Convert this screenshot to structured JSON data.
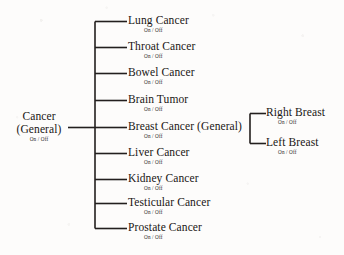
{
  "diagram": {
    "type": "tree",
    "state_label": "On / Off",
    "line_color": "#231f1e",
    "background_color": "#fdfcfb",
    "root": {
      "label_line1": "Cancer",
      "label_line2": "(General)",
      "state": "On / Off"
    },
    "branches": [
      {
        "label": "Lung Cancer",
        "state": "On / Off"
      },
      {
        "label": "Throat Cancer",
        "state": "On / Off"
      },
      {
        "label": "Bowel Cancer",
        "state": "On / Off"
      },
      {
        "label": "Brain Tumor",
        "state": "On / Off"
      },
      {
        "label": "Breast Cancer (General)",
        "state": "On / Off"
      },
      {
        "label": "Liver Cancer",
        "state": "On / Off"
      },
      {
        "label": "Kidney Cancer",
        "state": "On / Off"
      },
      {
        "label": "Testicular Cancer",
        "state": "On / Off"
      },
      {
        "label": "Prostate Cancer",
        "state": "On / Off"
      }
    ],
    "sub_branches": [
      {
        "label": "Right Breast",
        "state": "On / Off"
      },
      {
        "label": "Left Breast",
        "state": "On / Off"
      }
    ]
  }
}
